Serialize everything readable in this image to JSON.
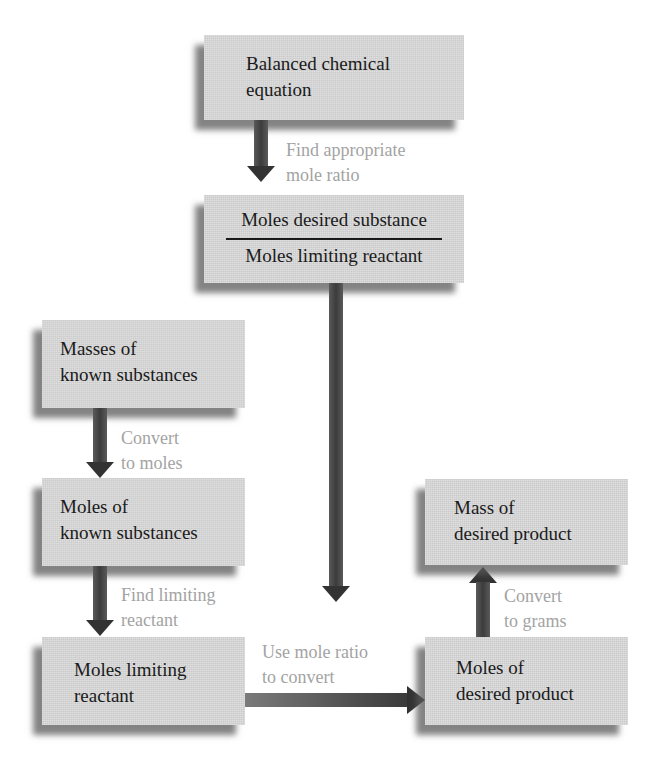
{
  "diagram": {
    "colors": {
      "box_fill": "#d9d9d9",
      "box_shadow": "#5a5a5a",
      "box_text": "#1a1a1a",
      "label_text": "#a3a3a3",
      "arrow": "#333333"
    },
    "boxes": {
      "balanced_equation": {
        "line1": "Balanced chemical",
        "line2": "equation"
      },
      "mole_ratio": {
        "numerator": "Moles desired substance",
        "denominator": "Moles limiting reactant"
      },
      "masses_known": {
        "line1": "Masses of",
        "line2": "known substances"
      },
      "moles_known": {
        "line1": "Moles of",
        "line2": "known substances"
      },
      "moles_limiting": {
        "line1": "Moles limiting",
        "line2": "reactant"
      },
      "moles_desired": {
        "line1": "Moles of",
        "line2": "desired product"
      },
      "mass_desired": {
        "line1": "Mass of",
        "line2": "desired product"
      }
    },
    "arrows": {
      "find_ratio": {
        "line1": "Find appropriate",
        "line2": "mole ratio",
        "direction": "down"
      },
      "ratio_to_convert": {
        "direction": "down"
      },
      "convert_moles": {
        "line1": "Convert",
        "line2": "to moles",
        "direction": "down"
      },
      "find_limiting": {
        "line1": "Find limiting",
        "line2": "reactant",
        "direction": "down"
      },
      "use_ratio": {
        "line1": "Use mole ratio",
        "line2": "to convert",
        "direction": "right"
      },
      "convert_grams": {
        "line1": "Convert",
        "line2": "to grams",
        "direction": "up"
      }
    }
  }
}
